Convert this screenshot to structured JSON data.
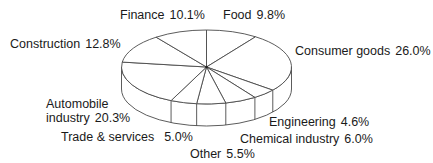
{
  "chart_data": {
    "type": "pie",
    "style": "3d-exploded-none",
    "title": "",
    "start_angle": "12 o'clock",
    "direction": "clockwise",
    "slices": [
      {
        "label": "Food",
        "value": 9.8,
        "display": "9.8%"
      },
      {
        "label": "Consumer goods",
        "value": 26.0,
        "display": "26.0%"
      },
      {
        "label": "Engineering",
        "value": 4.6,
        "display": "4.6%"
      },
      {
        "label": "Chemical industry",
        "value": 6.0,
        "display": "6.0%"
      },
      {
        "label": "Other",
        "value": 5.5,
        "display": "5.5%"
      },
      {
        "label": "Trade & services",
        "value": 5.0,
        "display": "5.0%"
      },
      {
        "label": "Automobile industry",
        "value": 20.3,
        "display": "20.3%"
      },
      {
        "label": "Construction",
        "value": 12.8,
        "display": "12.8%"
      },
      {
        "label": "Finance",
        "value": 10.1,
        "display": "10.1%"
      }
    ],
    "fill_color": "#ffffff",
    "line_color": "#4a4a4a",
    "legend": "none (labels placed around pie)"
  },
  "labels": {
    "finance": {
      "name": "Finance",
      "pct": "10.1%"
    },
    "food": {
      "name": "Food",
      "pct": "9.8%"
    },
    "consumer": {
      "name": "Consumer goods",
      "pct": "26.0%"
    },
    "construction": {
      "name": "Construction",
      "pct": "12.8%"
    },
    "automobile_line1": "Automobile",
    "automobile_line2": {
      "name": "industry",
      "pct": "20.3%"
    },
    "engineering": {
      "name": "Engineering",
      "pct": "4.6%"
    },
    "chemical": {
      "name": "Chemical industry",
      "pct": "6.0%"
    },
    "trade": {
      "name": "Trade & services",
      "pct": "5.0%"
    },
    "other": {
      "name": "Other",
      "pct": "5.5%"
    }
  }
}
